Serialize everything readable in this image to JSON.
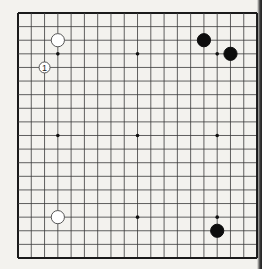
{
  "board": {
    "size": 19,
    "origin": {
      "x": 18,
      "y": 13
    },
    "spacing": {
      "x": 13.28,
      "y": 13.61
    },
    "line_color": "#3a3a3a",
    "border_color": "#1a1a1a",
    "star_points": [
      [
        4,
        4
      ],
      [
        10,
        4
      ],
      [
        16,
        4
      ],
      [
        4,
        10
      ],
      [
        10,
        10
      ],
      [
        16,
        10
      ],
      [
        4,
        16
      ],
      [
        10,
        16
      ],
      [
        16,
        16
      ]
    ]
  },
  "stones": [
    {
      "color": "white",
      "col": 4,
      "row": 3,
      "label": ""
    },
    {
      "color": "white",
      "col": 3,
      "row": 5,
      "label": "1",
      "size": "small"
    },
    {
      "color": "black",
      "col": 15,
      "row": 3,
      "label": ""
    },
    {
      "color": "black",
      "col": 17,
      "row": 4,
      "label": ""
    },
    {
      "color": "white",
      "col": 4,
      "row": 16,
      "label": ""
    },
    {
      "color": "black",
      "col": 16,
      "row": 17,
      "label": ""
    }
  ]
}
